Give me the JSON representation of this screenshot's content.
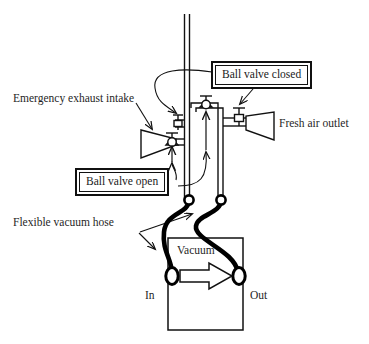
{
  "diagram": {
    "background_color": "#ffffff",
    "line_color": "#111111",
    "hose_color": "#000000"
  },
  "labels": {
    "emergency_exhaust_intake": "Emergency exhaust intake",
    "fresh_air_outlet": "Fresh air outlet",
    "flexible_vacuum_hose": "Flexible vacuum hose",
    "ball_valve_closed": "Ball valve closed",
    "ball_valve_open": "Ball valve open",
    "vacuum": "Vacuum",
    "in": "In",
    "out": "Out"
  },
  "components": {
    "vertical_pipe": "double-line vertical duct",
    "left_horn": "emergency exhaust intake horn",
    "right_horn": "fresh air outlet horn",
    "vacuum_box": "Vacuum",
    "valves": [
      {
        "name": "top-ball-valve",
        "state": "open",
        "position": "top of lower manifold"
      },
      {
        "name": "left-horn-ball-valve",
        "state": "open",
        "position": "emergency exhaust intake horn"
      },
      {
        "name": "mid-left-ball-valve",
        "state": "closed",
        "position": "vertical pipe left branch"
      },
      {
        "name": "right-horn-ball-valve",
        "state": "closed",
        "position": "fresh air outlet horn"
      }
    ],
    "hose_ports": [
      {
        "name": "left-port",
        "label": "In"
      },
      {
        "name": "right-port",
        "label": "Out"
      }
    ],
    "flow_arrow": "left-to-right through vacuum unit"
  }
}
